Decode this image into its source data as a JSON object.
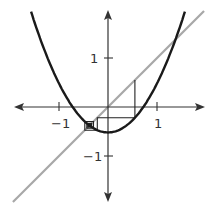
{
  "colors": {
    "background": "#ffffff",
    "axis": "#333333",
    "curve": "#1a1a1a",
    "diagonal": "#a8a8a8",
    "cobweb": "#222222"
  },
  "axes": {
    "x_ticks": [
      {
        "value": -1,
        "label": "−1"
      },
      {
        "value": 1,
        "label": "1"
      }
    ],
    "y_ticks": [
      {
        "value": 1,
        "label": "1"
      },
      {
        "value": -1,
        "label": "−1"
      }
    ]
  },
  "chart_data": {
    "type": "line",
    "title": "",
    "xlabel": "",
    "ylabel": "",
    "xlim": [
      -1.88,
      1.95
    ],
    "ylim": [
      -1.91,
      1.94
    ],
    "grid": false,
    "series": [
      {
        "name": "f(x) = x^2 - 0.52",
        "kind": "parabola",
        "c": 0.52,
        "x_range": [
          -1.57,
          1.57
        ]
      },
      {
        "name": "y = x",
        "kind": "diagonal",
        "x_range": [
          -1.94,
          1.96
        ]
      },
      {
        "name": "cobweb iteration",
        "kind": "cobweb",
        "x0": 0.55,
        "iterates": [
          0.55,
          -0.2175,
          -0.4727,
          -0.2966,
          -0.432,
          -0.3334,
          -0.4088,
          -0.3529,
          -0.3954,
          -0.3637,
          -0.3877
        ]
      }
    ],
    "tick_labels": {
      "x": [
        "−1",
        "1"
      ],
      "y": [
        "1",
        "−1"
      ]
    }
  }
}
